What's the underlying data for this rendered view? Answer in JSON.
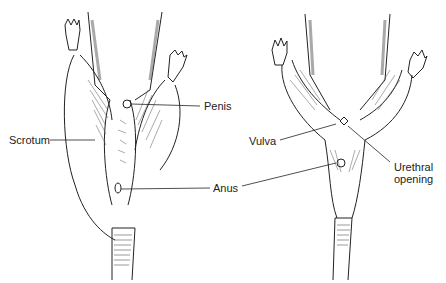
{
  "figure": {
    "type": "anatomical line drawing",
    "panels": [
      {
        "id": "male",
        "labels": [
          {
            "text": "Penis",
            "x": 204,
            "y": 101
          },
          {
            "text": "Scrotum",
            "x": 9,
            "y": 135
          },
          {
            "text": "Anus",
            "x": 213,
            "y": 183
          }
        ]
      },
      {
        "id": "female",
        "labels": [
          {
            "text": "Vulva",
            "x": 249,
            "y": 140
          },
          {
            "text": "Urethral",
            "x": 394,
            "y": 161
          },
          {
            "text": "opening",
            "x": 394,
            "y": 173
          }
        ]
      }
    ]
  },
  "colors": {
    "ink": "#222222",
    "background": "#ffffff",
    "shade": "#666666"
  }
}
